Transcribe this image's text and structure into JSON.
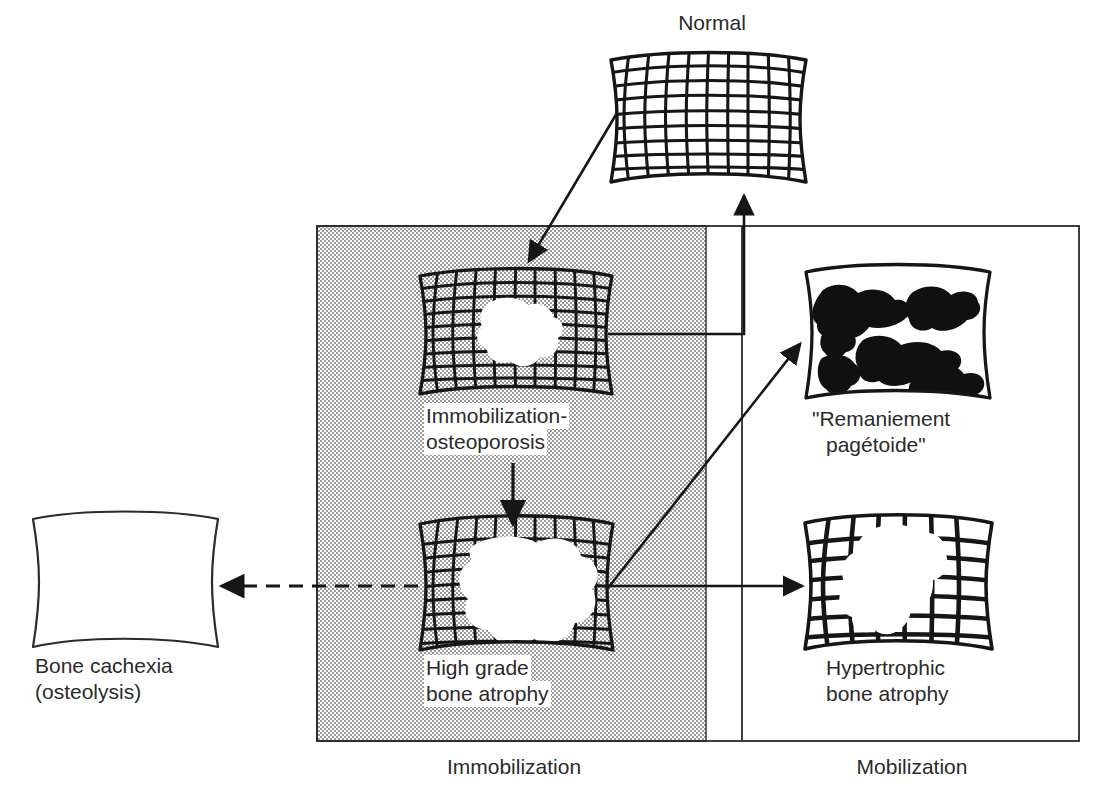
{
  "figure": {
    "type": "flow-diagram",
    "title_visible": false,
    "background": "#ffffff",
    "ink_color": "#1a1a1a",
    "shaded_color": "#d9d9d9",
    "text_color": "#2b2b2b"
  },
  "zones": [
    {
      "id": "immobilization",
      "label": "Immobilization",
      "shaded": true,
      "x": 317,
      "y": 226,
      "w": 389,
      "h": 515
    },
    {
      "id": "mobilization",
      "label": "Mobilization",
      "shaded": false,
      "x": 706,
      "y": 226,
      "w": 373,
      "h": 515
    }
  ],
  "nodes": [
    {
      "id": "normal",
      "label": "Normal",
      "label_lines": [
        "Normal"
      ],
      "label_position": "above",
      "pattern": "fine-regular-grid",
      "cols": 10,
      "rows": 9,
      "lesion": "none",
      "x": 610,
      "y": 52,
      "w": 200,
      "h": 134
    },
    {
      "id": "immobilization-osteoporosis",
      "label": "Immobilization-osteoporosis",
      "label_lines": [
        "Immobilization-",
        "osteoporosis"
      ],
      "label_position": "below",
      "pattern": "fine-grid-with-small-lesion",
      "cols": 10,
      "rows": 9,
      "lesion": "small-central-blotch",
      "x": 420,
      "y": 268,
      "w": 194,
      "h": 130
    },
    {
      "id": "high-grade-bone-atrophy",
      "label": "High grade bone atrophy",
      "label_lines": [
        "High grade",
        "bone atrophy"
      ],
      "label_position": "below",
      "pattern": "fine-grid-with-large-lesion",
      "cols": 10,
      "rows": 9,
      "lesion": "large-central-blotch",
      "x": 420,
      "y": 516,
      "w": 194,
      "h": 136
    },
    {
      "id": "remaniement-pagetoide",
      "label": "\"Remaniement pagétoide\"",
      "label_lines": [
        "\"Remaniement",
        "pagétoide\""
      ],
      "label_position": "below",
      "pattern": "blobs",
      "lesion": "dark-irregular-patches",
      "blob_count": 6,
      "x": 803,
      "y": 266,
      "w": 190,
      "h": 135
    },
    {
      "id": "hypertrophic-bone-atrophy",
      "label": "Hypertrophic bone atrophy",
      "label_lines": [
        "Hypertrophic",
        "bone atrophy"
      ],
      "label_position": "below",
      "pattern": "coarse-thick-grid-with-lesion",
      "cols": 7,
      "rows": 7,
      "lesion": "central-branching-blotch",
      "x": 803,
      "y": 515,
      "w": 190,
      "h": 136
    },
    {
      "id": "bone-cachexia",
      "label": "Bone cachexia (osteolysis)",
      "label_lines": [
        "Bone cachexia",
        "(osteolysis)"
      ],
      "label_position": "below",
      "pattern": "empty",
      "lesion": "none",
      "x": 32,
      "y": 511,
      "w": 188,
      "h": 137
    }
  ],
  "edges": [
    {
      "id": "normal-to-osteoporosis",
      "from": "normal",
      "to": "immobilization-osteoporosis",
      "style": "solid",
      "shape": "diagonal"
    },
    {
      "id": "osteoporosis-to-normal",
      "from": "immobilization-osteoporosis",
      "to": "normal",
      "style": "solid",
      "shape": "orthogonal-right-up"
    },
    {
      "id": "osteoporosis-to-high-grade",
      "from": "immobilization-osteoporosis",
      "to": "high-grade-bone-atrophy",
      "style": "solid",
      "shape": "vertical"
    },
    {
      "id": "high-grade-to-remaniement",
      "from": "high-grade-bone-atrophy",
      "to": "remaniement-pagetoide",
      "style": "solid",
      "shape": "diagonal"
    },
    {
      "id": "high-grade-to-hypertrophic",
      "from": "high-grade-bone-atrophy",
      "to": "hypertrophic-bone-atrophy",
      "style": "solid",
      "shape": "horizontal"
    },
    {
      "id": "high-grade-to-bone-cachexia",
      "from": "high-grade-bone-atrophy",
      "to": "bone-cachexia",
      "style": "dashed",
      "shape": "horizontal"
    }
  ],
  "labels": {
    "normal": "Normal",
    "immobilization_osteoporosis_l1": "Immobilization-",
    "immobilization_osteoporosis_l2": "osteoporosis",
    "high_grade_l1": "High grade",
    "high_grade_l2": "bone atrophy",
    "remaniement_l1": "\"Remaniement",
    "remaniement_l2": "pagétoide\"",
    "hypertrophic_l1": "Hypertrophic",
    "hypertrophic_l2": "bone atrophy",
    "cachexia_l1": "Bone cachexia",
    "cachexia_l2": "(osteolysis)",
    "zone_immobilization": "Immobilization",
    "zone_mobilization": "Mobilization"
  }
}
